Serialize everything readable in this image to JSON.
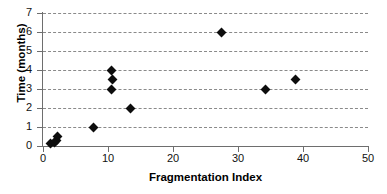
{
  "chart_data": {
    "type": "scatter",
    "title": "",
    "xlabel": "Fragmentation Index",
    "ylabel": "Time (months)",
    "xlim": [
      0,
      50
    ],
    "ylim": [
      0,
      7
    ],
    "xticks": [
      0,
      10,
      20,
      30,
      40,
      50
    ],
    "yticks": [
      0,
      1,
      2,
      3,
      4,
      5,
      6,
      7
    ],
    "grid": "horizontal-dashed",
    "legend": "none",
    "marker": "diamond",
    "marker_color": "#0d0d0d",
    "points": [
      {
        "x": 1.2,
        "y": 0.15
      },
      {
        "x": 1.7,
        "y": 0.2
      },
      {
        "x": 2.1,
        "y": 0.3
      },
      {
        "x": 2.3,
        "y": 0.5
      },
      {
        "x": 7.8,
        "y": 1.0
      },
      {
        "x": 10.6,
        "y": 3.0
      },
      {
        "x": 10.7,
        "y": 3.5
      },
      {
        "x": 10.6,
        "y": 4.0
      },
      {
        "x": 13.4,
        "y": 2.0
      },
      {
        "x": 27.5,
        "y": 6.0
      },
      {
        "x": 34.2,
        "y": 3.0
      },
      {
        "x": 38.9,
        "y": 3.5
      }
    ]
  }
}
